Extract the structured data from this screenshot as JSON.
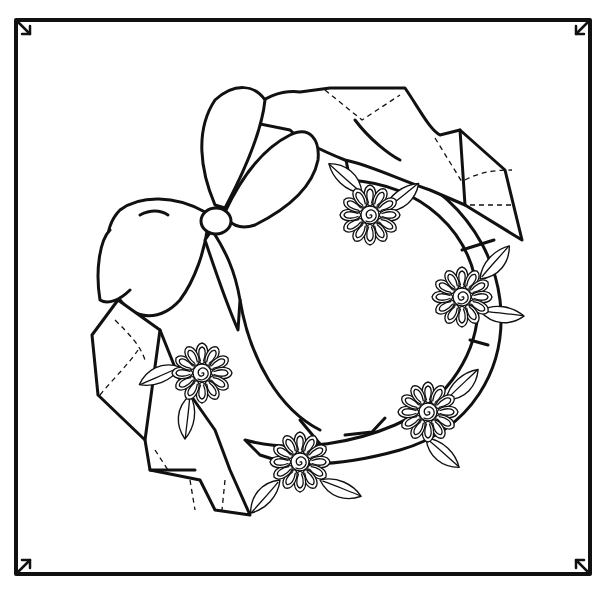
{
  "illustration": {
    "subject": "Wreath with bow and ribbon-embroidery flowers",
    "style": "black line art on white",
    "colors": {
      "ink": "#111111",
      "paper": "#ffffff"
    },
    "frame": {
      "x": 16,
      "y": 20,
      "width": 574,
      "height": 554
    },
    "corner_arrows": [
      {
        "corner": "top-left",
        "direction": "down-right"
      },
      {
        "corner": "top-right",
        "direction": "down-left"
      },
      {
        "corner": "bottom-left",
        "direction": "up-right"
      },
      {
        "corner": "bottom-right",
        "direction": "up-left"
      }
    ],
    "bow": {
      "cx": 215,
      "cy": 220
    },
    "flowers": [
      {
        "name": "flower-top",
        "cx": 370,
        "cy": 215
      },
      {
        "name": "flower-right",
        "cx": 462,
        "cy": 297
      },
      {
        "name": "flower-lower-right",
        "cx": 428,
        "cy": 412
      },
      {
        "name": "flower-bottom",
        "cx": 300,
        "cy": 462
      },
      {
        "name": "flower-left",
        "cx": 202,
        "cy": 373
      }
    ]
  }
}
